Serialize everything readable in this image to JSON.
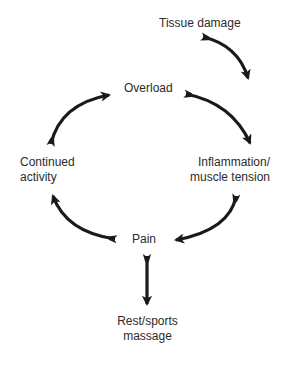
{
  "diagram": {
    "type": "cycle-flow",
    "nodes": {
      "tissue_damage": {
        "label": "Tissue damage"
      },
      "overload": {
        "label": "Overload"
      },
      "continued_activity": {
        "line1": "Continued",
        "line2": "activity"
      },
      "inflammation": {
        "line1": "Inflammation/",
        "line2": "muscle tension"
      },
      "pain": {
        "label": "Pain"
      },
      "rest": {
        "line1": "Rest/sports",
        "line2": "massage"
      }
    },
    "edges": [
      {
        "from": "Tissue damage",
        "to": "Inflammation/muscle tension"
      },
      {
        "from": "Overload",
        "to": "Inflammation/muscle tension"
      },
      {
        "from": "Inflammation/muscle tension",
        "to": "Pain"
      },
      {
        "from": "Pain",
        "to": "Continued activity"
      },
      {
        "from": "Continued activity",
        "to": "Overload"
      },
      {
        "from": "Pain",
        "to": "Rest/sports massage"
      }
    ],
    "colors": {
      "arrow": "#1a1a1a",
      "text": "#2b2b2b",
      "background": "#ffffff"
    }
  }
}
